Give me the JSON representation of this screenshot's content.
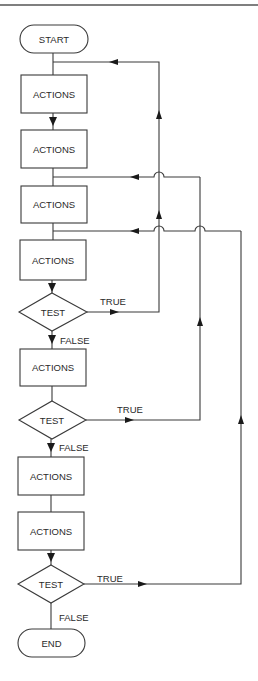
{
  "diagram": {
    "type": "flowchart",
    "nodes": [
      {
        "id": "start",
        "shape": "terminal",
        "label": "START"
      },
      {
        "id": "a1",
        "shape": "process",
        "label": "ACTIONS"
      },
      {
        "id": "a2",
        "shape": "process",
        "label": "ACTIONS"
      },
      {
        "id": "a3",
        "shape": "process",
        "label": "ACTIONS"
      },
      {
        "id": "a4",
        "shape": "process",
        "label": "ACTIONS"
      },
      {
        "id": "t1",
        "shape": "decision",
        "label": "TEST"
      },
      {
        "id": "a5",
        "shape": "process",
        "label": "ACTIONS"
      },
      {
        "id": "t2",
        "shape": "decision",
        "label": "TEST"
      },
      {
        "id": "a6",
        "shape": "process",
        "label": "ACTIONS"
      },
      {
        "id": "a7",
        "shape": "process",
        "label": "ACTIONS"
      },
      {
        "id": "t3",
        "shape": "decision",
        "label": "TEST"
      },
      {
        "id": "end",
        "shape": "terminal",
        "label": "END"
      }
    ],
    "edges": [
      {
        "from": "start",
        "to": "a1",
        "label": ""
      },
      {
        "from": "a1",
        "to": "a2",
        "label": ""
      },
      {
        "from": "a2",
        "to": "a3",
        "label": ""
      },
      {
        "from": "a3",
        "to": "a4",
        "label": ""
      },
      {
        "from": "a4",
        "to": "t1",
        "label": ""
      },
      {
        "from": "t1",
        "to": "a1",
        "label": "TRUE",
        "kind": "loop-back"
      },
      {
        "from": "t1",
        "to": "a5",
        "label": "FALSE"
      },
      {
        "from": "a5",
        "to": "t2",
        "label": ""
      },
      {
        "from": "t2",
        "to": "a3",
        "label": "TRUE",
        "kind": "loop-back"
      },
      {
        "from": "t2",
        "to": "a6",
        "label": "FALSE"
      },
      {
        "from": "a6",
        "to": "a7",
        "label": ""
      },
      {
        "from": "a7",
        "to": "t3",
        "label": ""
      },
      {
        "from": "t3",
        "to": "a4",
        "label": "TRUE",
        "kind": "loop-back"
      },
      {
        "from": "t3",
        "to": "end",
        "label": "FALSE"
      }
    ],
    "labels": {
      "start": "START",
      "end": "END",
      "action": "ACTIONS",
      "test": "TEST",
      "true": "TRUE",
      "false": "FALSE"
    }
  }
}
